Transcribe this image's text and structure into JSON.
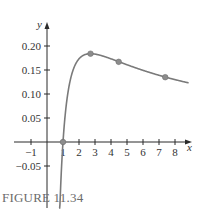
{
  "figure": {
    "caption": "FIGURE 11.34"
  },
  "chart_data": {
    "type": "line",
    "title": "",
    "xlabel": "x",
    "ylabel": "y",
    "function": "y = ln(x) / (2x)",
    "xlim": [
      -1.4,
      8.9
    ],
    "ylim": [
      -0.1,
      0.23
    ],
    "grid": false,
    "legend": null,
    "x_ticks": [
      -1,
      1,
      2,
      3,
      4,
      5,
      6,
      7,
      8
    ],
    "x_tick_labels": [
      "−1",
      "1",
      "2",
      "3",
      "4",
      "5",
      "6",
      "7",
      "8"
    ],
    "y_ticks": [
      -0.05,
      0.05,
      0.1,
      0.15,
      0.2
    ],
    "y_tick_labels": [
      "−0.05",
      "0.05",
      "0.10",
      "0.15",
      "0.20"
    ],
    "series": [
      {
        "name": "curve",
        "x_start": 0.75,
        "x_end": 8.85,
        "color": "#7a7a7a"
      }
    ],
    "marked_points": [
      {
        "x": 1.0,
        "y": 0.0
      },
      {
        "x": 2.72,
        "y": 0.184
      },
      {
        "x": 4.48,
        "y": 0.167
      },
      {
        "x": 7.39,
        "y": 0.135
      }
    ],
    "colors": {
      "axis": "#2b2b2b",
      "curve": "#7a7a7a",
      "marker": "#8c8c8c"
    }
  }
}
